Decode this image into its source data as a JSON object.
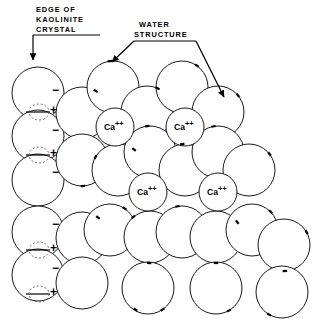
{
  "figure": {
    "title_present": false,
    "background_color": "#ffffff",
    "line_color": "#1a1a1a",
    "dashed_color": "#6e6e6e",
    "width": 326,
    "height": 328
  },
  "callouts": [
    {
      "id": "edge-of-kaolinite-crystal",
      "lines": [
        "EDGE OF",
        "KAOLINITE",
        "CRYSTAL"
      ],
      "line1": "EDGE OF",
      "line2": "KAOLINITE",
      "line3": "CRYSTAL",
      "text_x": 36,
      "text_y": 12,
      "line_height": 10,
      "rule": {
        "x1": 33,
        "y1": 35,
        "x2": 100,
        "y2": 35
      },
      "leader": "M33,35 L33,50 L33,62",
      "arrow_tip": {
        "x": 33,
        "y": 64
      }
    },
    {
      "id": "water-structure",
      "lines": [
        "WATER",
        "STRUCTURE"
      ],
      "line1": "WATER",
      "line2": "STRUCTURE",
      "text_x": 139,
      "text_y": 27,
      "line_height": 10,
      "rule": {
        "x1": 134,
        "y1": 49,
        "x2": 196,
        "y2": 49
      },
      "leader_left": "M134,49 L110,65",
      "leader_right": "M196,49 L225,100",
      "arrow_tip_left": {
        "x": 108,
        "y": 66
      },
      "arrow_tip_right": {
        "x": 227,
        "y": 102
      }
    }
  ],
  "legend_semantics": {
    "water_molecule": "large open circle",
    "calcium_ion": "small circle labelled Ca++",
    "negative_site": "minus sign on crystal edge",
    "positive_site": "plus sign with dashed circle on crystal edge",
    "dipole_marker": "short tick on circle circumference"
  },
  "ions": [
    {
      "label_base": "Ca",
      "label_charge": "++",
      "cx": 115,
      "cy": 127,
      "r": 19
    },
    {
      "label_base": "Ca",
      "label_charge": "++",
      "cx": 185,
      "cy": 127,
      "r": 19
    },
    {
      "label_base": "Ca",
      "label_charge": "++",
      "cx": 148,
      "cy": 192,
      "r": 19
    },
    {
      "label_base": "Ca",
      "label_charge": "++",
      "cx": 218,
      "cy": 192,
      "r": 19
    }
  ],
  "edge_signs": {
    "minus": "−",
    "plus": "+",
    "minus_positions": [
      {
        "x": 52,
        "y": 94
      },
      {
        "x": 52,
        "y": 134
      },
      {
        "x": 52,
        "y": 176
      },
      {
        "x": 52,
        "y": 228
      },
      {
        "x": 52,
        "y": 272
      }
    ],
    "plus_positions": [
      {
        "x": 50,
        "y": 114
      },
      {
        "x": 50,
        "y": 157
      },
      {
        "x": 50,
        "y": 252
      },
      {
        "x": 50,
        "y": 296
      }
    ],
    "dashed_site_positions": [
      {
        "cx": 39,
        "cy": 112,
        "rx": 10,
        "ry": 8
      },
      {
        "cx": 39,
        "cy": 155,
        "rx": 10,
        "ry": 8
      },
      {
        "cx": 39,
        "cy": 250,
        "rx": 10,
        "ry": 8
      },
      {
        "cx": 39,
        "cy": 294,
        "rx": 10,
        "ry": 8
      }
    ],
    "site_tick_positions": [
      {
        "x1": 26,
        "y1": 112,
        "x2": 50,
        "y2": 112
      },
      {
        "x1": 26,
        "y1": 155,
        "x2": 50,
        "y2": 155
      },
      {
        "x1": 26,
        "y1": 250,
        "x2": 50,
        "y2": 250
      },
      {
        "x1": 26,
        "y1": 294,
        "x2": 50,
        "y2": 294
      }
    ]
  },
  "chart_data": {
    "type": "scatter",
    "xlabel": "",
    "ylabel": "",
    "circle_radius": 26,
    "water_molecules": [
      {
        "cx": 38,
        "cy": 93
      },
      {
        "cx": 38,
        "cy": 136
      },
      {
        "cx": 38,
        "cy": 180
      },
      {
        "cx": 38,
        "cy": 232
      },
      {
        "cx": 38,
        "cy": 275
      },
      {
        "cx": 82,
        "cy": 113
      },
      {
        "cx": 82,
        "cy": 160
      },
      {
        "cx": 82,
        "cy": 238
      },
      {
        "cx": 82,
        "cy": 283
      },
      {
        "cx": 113,
        "cy": 87
      },
      {
        "cx": 118,
        "cy": 170
      },
      {
        "cx": 110,
        "cy": 230
      },
      {
        "cx": 147,
        "cy": 112
      },
      {
        "cx": 150,
        "cy": 152
      },
      {
        "cx": 150,
        "cy": 237
      },
      {
        "cx": 148,
        "cy": 288
      },
      {
        "cx": 182,
        "cy": 87
      },
      {
        "cx": 185,
        "cy": 170
      },
      {
        "cx": 182,
        "cy": 232
      },
      {
        "cx": 218,
        "cy": 112
      },
      {
        "cx": 218,
        "cy": 152
      },
      {
        "cx": 216,
        "cy": 237
      },
      {
        "cx": 216,
        "cy": 288
      },
      {
        "cx": 249,
        "cy": 170
      },
      {
        "cx": 252,
        "cy": 230
      },
      {
        "cx": 284,
        "cy": 245
      },
      {
        "cx": 282,
        "cy": 292
      }
    ],
    "dipole_ticks": [
      {
        "cx": 113,
        "cy": 87,
        "angle": -97
      },
      {
        "cx": 82,
        "cy": 113,
        "angle": -58
      },
      {
        "cx": 147,
        "cy": 112,
        "angle": -66
      },
      {
        "cx": 182,
        "cy": 87,
        "angle": -55
      },
      {
        "cx": 218,
        "cy": 112,
        "angle": -40
      },
      {
        "cx": 150,
        "cy": 152,
        "angle": -96
      },
      {
        "cx": 218,
        "cy": 152,
        "angle": -100
      },
      {
        "cx": 82,
        "cy": 160,
        "angle": 88
      },
      {
        "cx": 118,
        "cy": 170,
        "angle": -150
      },
      {
        "cx": 118,
        "cy": 170,
        "angle": -52
      },
      {
        "cx": 185,
        "cy": 170,
        "angle": -96
      },
      {
        "cx": 249,
        "cy": 170,
        "angle": -38
      },
      {
        "cx": 182,
        "cy": 232,
        "angle": -100
      },
      {
        "cx": 252,
        "cy": 230,
        "angle": -44
      },
      {
        "cx": 110,
        "cy": 230,
        "angle": -56
      },
      {
        "cx": 150,
        "cy": 237,
        "angle": -130
      },
      {
        "cx": 216,
        "cy": 237,
        "angle": -35
      },
      {
        "cx": 284,
        "cy": 245,
        "angle": -30
      },
      {
        "cx": 150,
        "cy": 237,
        "angle": 92
      },
      {
        "cx": 216,
        "cy": 237,
        "angle": 90
      },
      {
        "cx": 284,
        "cy": 245,
        "angle": 88
      },
      {
        "cx": 148,
        "cy": 288,
        "angle": 56
      },
      {
        "cx": 216,
        "cy": 288,
        "angle": 60
      },
      {
        "cx": 282,
        "cy": 292,
        "angle": 120
      },
      {
        "cx": 150,
        "cy": 288,
        "angle": 124
      },
      {
        "cx": 82,
        "cy": 238,
        "angle": -52
      }
    ]
  }
}
